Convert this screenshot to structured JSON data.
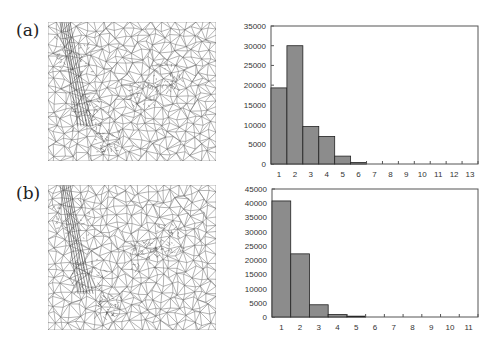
{
  "panels": [
    {
      "label": "(a)",
      "mesh": "triangular-mesh-a",
      "histogram_index": 0
    },
    {
      "label": "(b)",
      "mesh": "triangular-mesh-b",
      "histogram_index": 1
    }
  ],
  "style": {
    "bar_fill": "#8c8c8c",
    "bar_stroke": "#222222",
    "frame": "#555555",
    "mesh_stroke": "#6a6a6a"
  },
  "chart_data": [
    {
      "type": "bar",
      "title": "",
      "xlabel": "",
      "ylabel": "",
      "categories": [
        "1",
        "2",
        "3",
        "4",
        "5",
        "6",
        "7",
        "8",
        "9",
        "10",
        "11",
        "12",
        "13"
      ],
      "values": [
        19300,
        30000,
        9500,
        7000,
        2000,
        400,
        0,
        0,
        0,
        0,
        0,
        0,
        0
      ],
      "yticks": [
        0,
        5000,
        10000,
        15000,
        20000,
        25000,
        30000,
        35000
      ],
      "ylim": [
        0,
        35000
      ],
      "grid": false,
      "legend": null
    },
    {
      "type": "bar",
      "title": "",
      "xlabel": "",
      "ylabel": "",
      "categories": [
        "1",
        "2",
        "3",
        "4",
        "5",
        "6",
        "7",
        "8",
        "9",
        "10",
        "11"
      ],
      "values": [
        40800,
        22200,
        4300,
        900,
        300,
        0,
        0,
        0,
        0,
        0,
        0
      ],
      "yticks": [
        0,
        5000,
        10000,
        15000,
        20000,
        25000,
        30000,
        35000,
        40000,
        45000
      ],
      "ylim": [
        0,
        45000
      ],
      "grid": false,
      "legend": null
    }
  ]
}
